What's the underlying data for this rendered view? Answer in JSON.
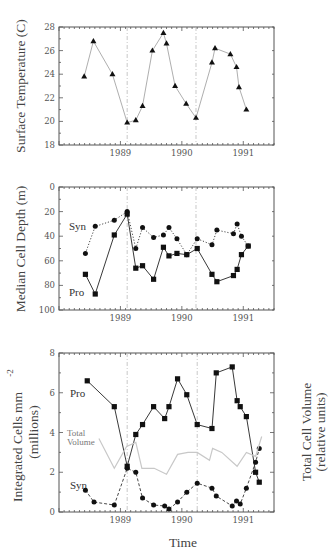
{
  "chart_data": [
    {
      "type": "line",
      "title": "",
      "xlabel": "",
      "ylabel": "Surface Temperature (C)",
      "xlim": [
        1988.0,
        1991.5
      ],
      "ylim": [
        18,
        28
      ],
      "x_ticks": [
        "1989",
        "1990",
        "1991"
      ],
      "y_ticks": [
        "18",
        "20",
        "22",
        "24",
        "26",
        "28"
      ],
      "reference_lines_x": [
        1989.11,
        1990.23
      ],
      "grid": false,
      "series": [
        {
          "name": "Surface Temperature",
          "marker": "triangle",
          "line": "solid-light",
          "x": [
            1988.41,
            1988.56,
            1988.87,
            1989.11,
            1989.25,
            1989.36,
            1989.52,
            1989.7,
            1989.75,
            1989.89,
            1990.07,
            1990.23,
            1990.49,
            1990.54,
            1990.79,
            1990.89,
            1990.93,
            1991.05
          ],
          "y": [
            23.8,
            26.8,
            24.0,
            19.9,
            20.1,
            21.3,
            26.0,
            27.5,
            26.6,
            23.0,
            21.5,
            20.3,
            25.0,
            26.2,
            25.7,
            24.6,
            22.9,
            21.0
          ]
        }
      ]
    },
    {
      "type": "line",
      "title": "",
      "xlabel": "",
      "ylabel": "Median Cell Depth (m)",
      "xlim": [
        1988.0,
        1991.5
      ],
      "ylim": [
        100,
        0
      ],
      "y_inverted": true,
      "x_ticks": [
        "1989",
        "1990",
        "1991"
      ],
      "y_ticks": [
        "0",
        "20",
        "40",
        "60",
        "80",
        "100"
      ],
      "reference_lines_x": [
        1989.11,
        1990.23
      ],
      "grid": false,
      "annotations": [
        "Syn",
        "Pro"
      ],
      "series": [
        {
          "name": "Syn",
          "marker": "circle",
          "line": "dotted",
          "x": [
            1988.43,
            1988.59,
            1988.9,
            1989.11,
            1989.25,
            1989.36,
            1989.54,
            1989.7,
            1989.79,
            1989.92,
            1990.08,
            1990.25,
            1990.49,
            1990.57,
            1990.84,
            1990.9,
            1990.97,
            1991.08
          ],
          "y": [
            54,
            32,
            27,
            20,
            50,
            33,
            41,
            39,
            33,
            42,
            55,
            42,
            47,
            35,
            38,
            30,
            40,
            48
          ]
        },
        {
          "name": "Pro",
          "marker": "square",
          "line": "solid",
          "x": [
            1988.43,
            1988.59,
            1988.9,
            1989.11,
            1989.25,
            1989.36,
            1989.54,
            1989.7,
            1989.79,
            1989.92,
            1990.08,
            1990.25,
            1990.49,
            1990.57,
            1990.84,
            1990.9,
            1990.97,
            1991.08
          ],
          "y": [
            71,
            87,
            39,
            22,
            66,
            64,
            75,
            49,
            56,
            54,
            55,
            50,
            71,
            77,
            72,
            67,
            55,
            48
          ]
        }
      ]
    },
    {
      "type": "line",
      "title": "",
      "xlabel": "Time",
      "ylabel": "Integrated Cells mm -2 (millions)",
      "ylabel_line1": "Integrated Cells mm",
      "ylabel_sup": "-2",
      "ylabel_line2": "(millions)",
      "y2label_line1": "Total Cell Volume",
      "y2label_line2": "(relative units)",
      "xlim": [
        1988.0,
        1991.5
      ],
      "ylim": [
        0,
        8
      ],
      "x_ticks": [
        "1989",
        "1990",
        "1991"
      ],
      "y_ticks": [
        "0",
        "2",
        "4",
        "6",
        "8"
      ],
      "reference_lines_x": [
        1989.11,
        1990.25
      ],
      "grid": false,
      "annotations": [
        "Pro",
        "Total",
        "Volume",
        "Syn"
      ],
      "series": [
        {
          "name": "Pro",
          "marker": "square",
          "line": "solid",
          "x": [
            1988.46,
            1988.9,
            1989.11,
            1989.25,
            1989.36,
            1989.54,
            1989.72,
            1989.79,
            1989.93,
            1990.08,
            1990.25,
            1990.49,
            1990.56,
            1990.82,
            1990.9,
            1990.95,
            1991.05,
            1991.2,
            1991.26
          ],
          "y": [
            6.6,
            5.3,
            2.3,
            3.9,
            4.4,
            5.3,
            4.7,
            5.3,
            6.7,
            5.9,
            4.4,
            4.2,
            7.0,
            7.3,
            5.6,
            5.3,
            4.8,
            2.0,
            1.5
          ]
        },
        {
          "name": "Syn",
          "marker": "circle",
          "line": "dashed",
          "x": [
            1988.43,
            1988.57,
            1988.9,
            1989.11,
            1989.25,
            1989.36,
            1989.54,
            1989.72,
            1989.79,
            1989.93,
            1990.08,
            1990.25,
            1990.49,
            1990.56,
            1990.82,
            1990.89,
            1990.95,
            1991.05,
            1991.2,
            1991.26
          ],
          "y": [
            1.1,
            0.5,
            0.35,
            2.2,
            2.0,
            0.7,
            0.35,
            0.3,
            0.15,
            0.5,
            1.0,
            1.45,
            1.2,
            0.8,
            0.3,
            0.55,
            0.4,
            1.2,
            2.5,
            3.2
          ]
        },
        {
          "name": "Total Volume",
          "marker": "none",
          "line": "solid-lightgray",
          "axis": "right",
          "x": [
            1988.65,
            1988.9,
            1989.1,
            1989.25,
            1989.35,
            1989.55,
            1989.75,
            1989.93,
            1990.1,
            1990.25,
            1990.45,
            1990.5,
            1990.65,
            1990.9,
            1991.05,
            1991.2,
            1991.3
          ],
          "y": [
            3.7,
            2.2,
            3.3,
            3.5,
            2.2,
            2.2,
            1.9,
            2.9,
            3.0,
            3.0,
            2.6,
            3.2,
            3.0,
            2.3,
            3.0,
            2.8,
            3.8
          ]
        }
      ]
    }
  ]
}
